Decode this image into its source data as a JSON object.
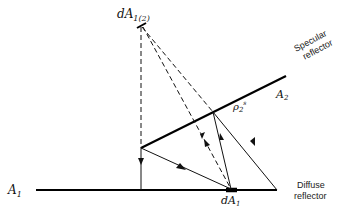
{
  "diagram": {
    "labels": {
      "source_element": "dA",
      "source_subscript": "1(2)",
      "specular_title_line1": "Specular",
      "specular_title_line2": "reflector",
      "specular_surface": "A",
      "specular_surface_sub": "2",
      "reflectivity": "ρ",
      "reflectivity_sub": "2",
      "reflectivity_sup": "s",
      "diffuse_surface": "A",
      "diffuse_surface_sub": "1",
      "diffuse_element": "dA",
      "diffuse_element_sub": "1",
      "diffuse_title_line1": "Diffuse",
      "diffuse_title_line2": "reflector"
    },
    "legend": {
      "dashed": "image ray paths",
      "solid": "actual ray paths"
    }
  }
}
